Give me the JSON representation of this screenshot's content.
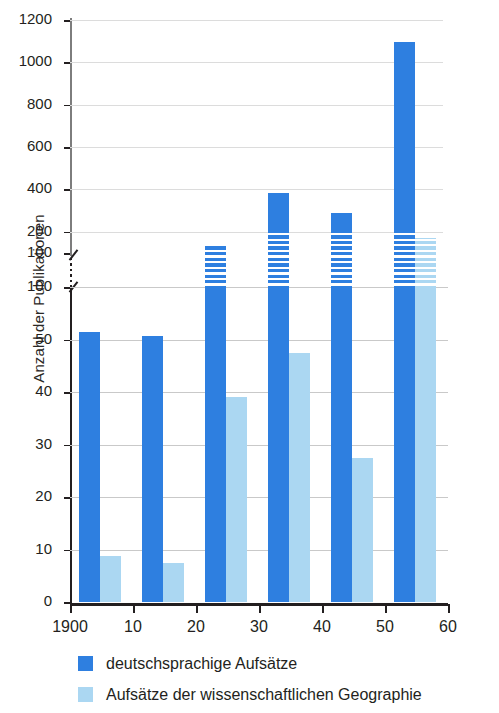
{
  "chart_data": {
    "type": "bar",
    "title": "",
    "xlabel": "",
    "ylabel": "Anzahl der Publikationen",
    "categories": [
      "1900",
      "1910",
      "1920",
      "1930",
      "1940",
      "1950"
    ],
    "x_tick_labels": [
      "1900",
      "10",
      "20",
      "30",
      "40",
      "50",
      "60"
    ],
    "x_tick_values": [
      1900,
      1910,
      1920,
      1930,
      1940,
      1950,
      1960
    ],
    "xlim": [
      1900,
      1960
    ],
    "y_tick_labels_lower": [
      "0",
      "10",
      "20",
      "30",
      "40",
      "50",
      "100"
    ],
    "y_tick_values_lower": [
      0,
      10,
      20,
      30,
      40,
      50,
      100
    ],
    "y_tick_labels_upper": [
      "100",
      "200",
      "400",
      "600",
      "800",
      "1000",
      "1200"
    ],
    "y_tick_values_upper": [
      100,
      200,
      400,
      600,
      800,
      1000,
      1200
    ],
    "ylim": [
      0,
      1200
    ],
    "axis_break": true,
    "axis_break_at": 100,
    "grid": true,
    "legend_position": "bottom-left",
    "series": [
      {
        "name": "deutschsprachige Aufsätze",
        "color": "#2E7FE0",
        "values": [
          57,
          53,
          140,
          385,
          290,
          1095
        ]
      },
      {
        "name": "Aufsätze der wissenschaftlichen Geographie",
        "color": "#ABD7F2",
        "values": [
          8.7,
          7.4,
          39,
          47.5,
          27.5,
          170
        ]
      }
    ]
  },
  "axis": {
    "y_title": "Anzahl der Publikationen"
  },
  "legend": {
    "items": [
      {
        "label": "deutschsprachige Aufsätze",
        "color": "#2E7FE0"
      },
      {
        "label": "Aufsätze der wissenschaftlichen Geographie",
        "color": "#ABD7F2"
      }
    ]
  },
  "colors": {
    "dark_blue": "#2E7FE0",
    "light_blue": "#ABD7F2",
    "axis": "#231f20",
    "grid": "#c9c9c9",
    "background": "#ffffff"
  }
}
